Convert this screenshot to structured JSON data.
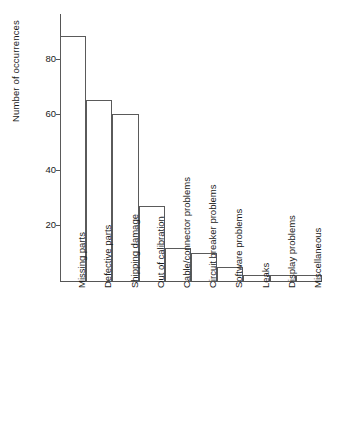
{
  "chart_data": {
    "type": "bar",
    "title": "",
    "subtitle": "",
    "xlabel": "",
    "ylabel": "Number of occurrences",
    "categories": [
      "Missing parts",
      "Defective parts",
      "Shipping damage",
      "Out of calibration",
      "Cable/connector problems",
      "Circuit breaker problems",
      "Software problems",
      "Leaks",
      "Display problems",
      "Miscellaneous"
    ],
    "values": [
      88,
      65,
      60,
      27,
      12,
      10,
      5,
      2,
      2,
      2
    ],
    "ylim": [
      0,
      96
    ],
    "yticks": [
      20,
      40,
      60,
      80
    ],
    "ytick_labels": [
      "20",
      "40",
      "60",
      "80"
    ],
    "grid": false,
    "legend": false,
    "legend_position": "none",
    "bar_fill_color": "#ffffff",
    "bar_edge_color": "#5a5a5a",
    "axis_color": "#555555",
    "background_color": "#ffffff"
  }
}
